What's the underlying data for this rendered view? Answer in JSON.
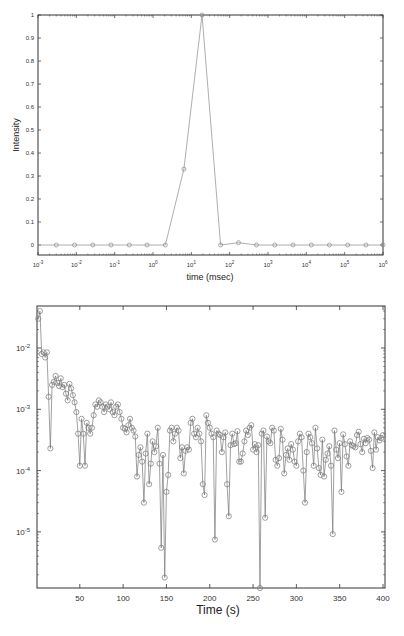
{
  "chart_data": [
    {
      "type": "line",
      "title": "",
      "xlabel": "time (msec)",
      "ylabel": "Intensity",
      "xscale": "log",
      "xlim": [
        0.001,
        1000000
      ],
      "ylim": [
        -0.05,
        1
      ],
      "xticks": [
        "10^-3",
        "10^-2",
        "10^-1",
        "10^0",
        "10^1",
        "10^2",
        "10^3",
        "10^4",
        "10^5",
        "10^6"
      ],
      "yticks": [
        "0",
        "0.1",
        "0.2",
        "0.3",
        "0.4",
        "0.5",
        "0.6",
        "0.7",
        "0.8",
        "0.9",
        "1"
      ],
      "grid": false,
      "marker": "circle",
      "x": [
        0.003,
        0.009,
        0.027,
        0.08,
        0.24,
        0.7,
        2.1,
        6.4,
        19,
        58,
        170,
        500,
        1500,
        4500,
        13500,
        40000,
        120000,
        360000,
        1000000
      ],
      "values": [
        0,
        0,
        0,
        0,
        0,
        0,
        0,
        0.33,
        1.0,
        0,
        0.01,
        0,
        0,
        0,
        0,
        0,
        0,
        0,
        0
      ]
    },
    {
      "type": "line",
      "title": "",
      "xlabel": "Time (s)",
      "ylabel": "",
      "yscale": "log",
      "xlim": [
        0,
        400
      ],
      "ylim": [
        1.2e-06,
        0.05
      ],
      "xticks": [
        "50",
        "100",
        "150",
        "200",
        "250",
        "300",
        "350",
        "400"
      ],
      "yticks": [
        "10^-2",
        "10^-3",
        "10^-4",
        "10^-5"
      ],
      "grid": false,
      "marker": "circle",
      "description": "Noisy decaying series sampled ~every 2 s; starts near 3e-2 at t≈2, drops to ~1e-3 by t≈50-100, then fluctuates around 1e-4 to 5e-4 with deep dips down to ~2e-6 (t≈148) and ~1e-6 (t≈258)",
      "x": [
        2,
        4,
        6,
        8,
        10,
        12,
        14,
        16,
        18,
        20,
        22,
        24,
        26,
        28,
        30,
        32,
        34,
        36,
        38,
        40,
        42,
        44,
        46,
        48,
        50,
        52,
        54,
        56,
        58,
        60,
        62,
        64,
        66,
        68,
        70,
        72,
        74,
        76,
        78,
        80,
        82,
        84,
        86,
        88,
        90,
        92,
        94,
        96,
        98,
        100,
        102,
        104,
        106,
        108,
        110,
        112,
        114,
        116,
        118,
        120,
        122,
        124,
        126,
        128,
        130,
        132,
        134,
        136,
        138,
        140,
        142,
        144,
        146,
        148,
        150,
        152,
        154,
        156,
        158,
        160,
        162,
        164,
        166,
        168,
        170,
        172,
        174,
        176,
        178,
        180,
        182,
        184,
        186,
        188,
        190,
        192,
        194,
        196,
        198,
        200,
        202,
        204,
        206,
        208,
        210,
        212,
        214,
        216,
        218,
        220,
        222,
        224,
        226,
        228,
        230,
        232,
        234,
        236,
        238,
        240,
        242,
        244,
        246,
        248,
        250,
        252,
        254,
        256,
        258,
        260,
        262,
        264,
        266,
        268,
        270,
        272,
        274,
        276,
        278,
        280,
        282,
        284,
        286,
        288,
        290,
        292,
        294,
        296,
        298,
        300,
        302,
        304,
        306,
        308,
        310,
        312,
        314,
        316,
        318,
        320,
        322,
        324,
        326,
        328,
        330,
        332,
        334,
        336,
        338,
        340,
        342,
        344,
        346,
        348,
        350,
        352,
        354,
        356,
        358,
        360,
        362,
        364,
        366,
        368,
        370,
        372,
        374,
        376,
        378,
        380,
        382,
        384,
        386,
        388,
        390,
        392,
        394,
        396,
        398,
        400
      ],
      "values": [
        0.03,
        0.04,
        0.008,
        0.0085,
        0.007,
        0.0085,
        0.0016,
        0.00023,
        0.0025,
        0.0028,
        0.0035,
        0.0027,
        0.0024,
        0.0032,
        0.0023,
        0.0025,
        0.0018,
        0.0014,
        0.0026,
        0.0022,
        0.0017,
        0.0013,
        0.0009,
        0.0004,
        0.00012,
        0.0007,
        0.0004,
        0.00012,
        0.0006,
        0.0005,
        0.0004,
        0.0005,
        0.0008,
        0.0012,
        0.0011,
        0.0014,
        0.0013,
        0.0011,
        0.0009,
        0.0012,
        0.0011,
        0.001,
        0.0013,
        0.0009,
        0.0008,
        0.0011,
        0.0012,
        0.0009,
        0.0007,
        0.0005,
        0.00048,
        0.00042,
        0.00055,
        0.0007,
        0.0005,
        0.00045,
        0.00036,
        8e-05,
        0.00018,
        0.00024,
        0.00014,
        3e-05,
        0.00019,
        0.0004,
        6e-05,
        0.00013,
        0.0003,
        0.0002,
        0.00025,
        0.0005,
        0.00013,
        5.5e-06,
        0.00018,
        1.8e-06,
        4.5e-05,
        8.5e-05,
        0.00045,
        0.0005,
        0.0003,
        0.0004,
        0.0005,
        0.00045,
        0.00016,
        0.00024,
        9e-05,
        0.00021,
        0.00024,
        0.00022,
        0.0006,
        0.0007,
        0.0004,
        0.00035,
        0.0005,
        0.0004,
        0.0003,
        6e-05,
        4e-05,
        0.0008,
        0.0006,
        0.0005,
        0.0004,
        0.00035,
        7.5e-06,
        0.00045,
        0.0004,
        0.00038,
        0.0002,
        0.00035,
        0.00042,
        6e-05,
        1.8e-05,
        0.00026,
        0.0004,
        0.00027,
        0.00028,
        0.00044,
        0.00014,
        0.00014,
        0.00019,
        0.0003,
        0.00045,
        0.00038,
        0.0005,
        0.00055,
        0.00022,
        0.00027,
        0.0002,
        0.00026,
        1.2e-06,
        0.0004,
        0.00045,
        1.7e-05,
        0.00036,
        0.0003,
        0.00028,
        0.0005,
        0.00045,
        0.00015,
        0.00012,
        0.00016,
        0.00048,
        0.00032,
        9e-05,
        0.00018,
        0.00023,
        0.00015,
        0.00027,
        0.00022,
        0.00014,
        0.00012,
        0.0003,
        0.0004,
        0.00035,
        0.0001,
        3e-05,
        0.0002,
        0.0004,
        0.00035,
        0.00028,
        0.00012,
        0.0005,
        0.00023,
        0.00011,
        8.5e-05,
        0.00032,
        8e-05,
        0.00015,
        0.00019,
        0.00025,
        0.00012,
        9.2e-06,
        0.00045,
        0.00022,
        0.00016,
        0.00028,
        4.5e-05,
        0.00039,
        0.00027,
        0.00017,
        0.00012,
        0.0003,
        0.00026,
        0.00025,
        0.00024,
        0.00038,
        0.00043,
        0.00027,
        0.0002,
        0.00033,
        0.00028,
        0.00034,
        0.00032,
        0.00021,
        0.00011,
        0.00042,
        0.00022,
        0.00035,
        0.00031,
        0.00034,
        0.00038,
        0.00036,
        0.00016,
        0.00036,
        0.00024,
        0.00018
      ]
    }
  ]
}
